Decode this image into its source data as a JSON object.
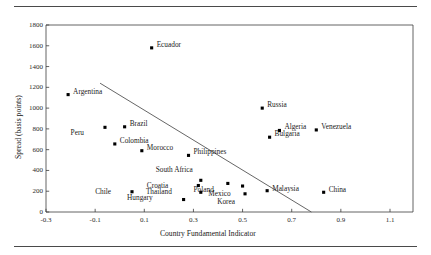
{
  "chart_data": {
    "type": "scatter",
    "title": "",
    "xlabel": "Country Fundamental Indicator",
    "ylabel": "Spread (basis points)",
    "xlim": [
      -0.3,
      1.2
    ],
    "ylim": [
      0,
      1800
    ],
    "xticks": [
      "-0.3",
      "-0.1",
      "0.1",
      "0.3",
      "0.5",
      "0.7",
      "0.9",
      "1.1"
    ],
    "xtick_values": [
      -0.3,
      -0.1,
      0.1,
      0.3,
      0.5,
      0.7,
      0.9,
      1.1
    ],
    "yticks": [
      "0",
      "200",
      "400",
      "600",
      "800",
      "1000",
      "1200",
      "1400",
      "1600",
      "1800"
    ],
    "ytick_values": [
      0,
      200,
      400,
      600,
      800,
      1000,
      1200,
      1400,
      1600,
      1800
    ],
    "grid": false,
    "legend": false,
    "marker": "filled-square",
    "marker_color": "#000000",
    "points": [
      {
        "name": "Argentina",
        "x": -0.21,
        "y": 1130,
        "label_dx": 5,
        "label_dy": -3
      },
      {
        "name": "Ecuador",
        "x": 0.13,
        "y": 1580,
        "label_dx": 5,
        "label_dy": -3
      },
      {
        "name": "Russia",
        "x": 0.58,
        "y": 1000,
        "label_dx": 5,
        "label_dy": -3
      },
      {
        "name": "Brazil",
        "x": 0.02,
        "y": 820,
        "label_dx": 5,
        "label_dy": -3
      },
      {
        "name": "Peru",
        "x": -0.06,
        "y": 815,
        "label_dx": -21,
        "label_dy": 6
      },
      {
        "name": "Venezuela",
        "x": 0.8,
        "y": 790,
        "label_dx": 5,
        "label_dy": -3
      },
      {
        "name": "Algeria",
        "x": 0.65,
        "y": 785,
        "label_dx": 5,
        "label_dy": -3
      },
      {
        "name": "Bulgaria",
        "x": 0.61,
        "y": 720,
        "label_dx": 5,
        "label_dy": -3
      },
      {
        "name": "Colombia",
        "x": -0.02,
        "y": 655,
        "label_dx": 5,
        "label_dy": -3
      },
      {
        "name": "Morocco",
        "x": 0.09,
        "y": 590,
        "label_dx": 5,
        "label_dy": -3
      },
      {
        "name": "Philippines",
        "x": 0.28,
        "y": 545,
        "label_dx": 5,
        "label_dy": -3
      },
      {
        "name": "South Africa",
        "x": 0.33,
        "y": 305,
        "label_dx": -8,
        "label_dy": -10
      },
      {
        "name": "Croatia",
        "x": 0.32,
        "y": 255,
        "label_dx": -30,
        "label_dy": 0
      },
      {
        "name": "Poland",
        "x": 0.44,
        "y": 275,
        "label_dx": -14,
        "label_dy": 7
      },
      {
        "name": "Mexico",
        "x": 0.5,
        "y": 250,
        "label_dx": -12,
        "label_dy": 8
      },
      {
        "name": "Malaysia",
        "x": 0.6,
        "y": 205,
        "label_dx": 5,
        "label_dy": -2
      },
      {
        "name": "Korea",
        "x": 0.51,
        "y": 175,
        "label_dx": -10,
        "label_dy": 8
      },
      {
        "name": "Thailand",
        "x": 0.33,
        "y": 190,
        "label_dx": -29,
        "label_dy": 0
      },
      {
        "name": "Chile",
        "x": 0.05,
        "y": 195,
        "label_dx": -21,
        "label_dy": 0
      },
      {
        "name": "Hungary",
        "x": 0.26,
        "y": 120,
        "label_dx": -31,
        "label_dy": -2
      },
      {
        "name": "China",
        "x": 0.83,
        "y": 190,
        "label_dx": 5,
        "label_dy": -2
      }
    ],
    "trendline": {
      "x_start": -0.08,
      "y_start": 1240,
      "x_end": 0.78,
      "y_end": 0,
      "color": "#555555"
    }
  },
  "axes": {
    "x_axis_name": "Country Fundamental Indicator",
    "y_axis_name": "Spread (basis points)"
  }
}
